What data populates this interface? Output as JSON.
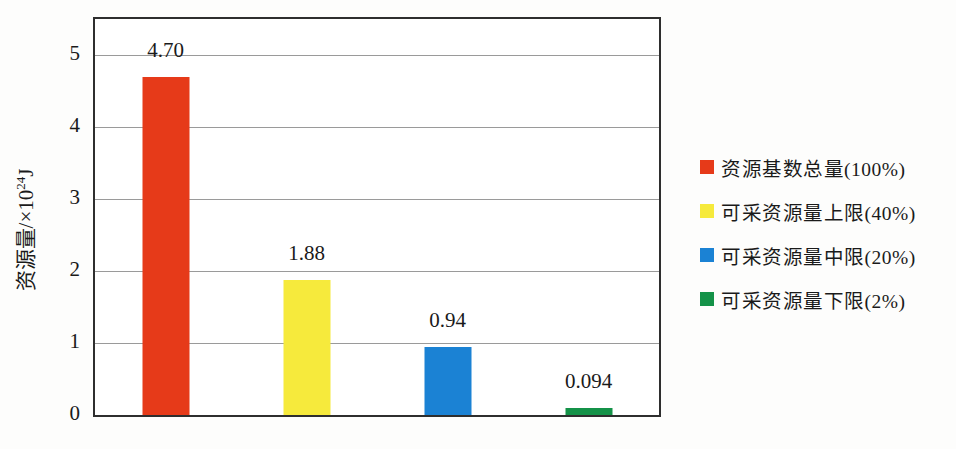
{
  "chart_data": {
    "type": "bar",
    "title": "",
    "xlabel": "",
    "ylabel": "资源量/×10^24 J",
    "ylabel_parts": {
      "prefix": "资源量/×10",
      "superscript": "24",
      "suffix": "J"
    },
    "ylim": [
      0,
      5.5
    ],
    "yticks": [
      0,
      1,
      2,
      3,
      4,
      5
    ],
    "grid": "horizontal",
    "legend_position": "right",
    "bars": [
      {
        "label": "资源基数总量(100%)",
        "value": 4.7,
        "value_label": "4.70",
        "color": "#e63a19"
      },
      {
        "label": "可采资源量上限(40%)",
        "value": 1.88,
        "value_label": "1.88",
        "color": "#f6ea3c"
      },
      {
        "label": "可采资源量中限(20%)",
        "value": 0.94,
        "value_label": "0.94",
        "color": "#1b82d4"
      },
      {
        "label": "可采资源量下限(2%)",
        "value": 0.094,
        "value_label": "0.094",
        "color": "#149248"
      }
    ]
  },
  "colors": {
    "plot_border": "#2e2e2e",
    "gridline": "#9a9a9a",
    "background": "#fdfdfc",
    "text": "#1a1a1a"
  }
}
